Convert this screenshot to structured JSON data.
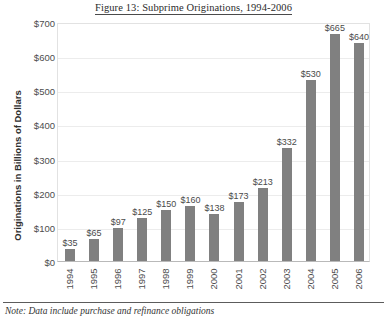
{
  "chart_data": {
    "type": "bar",
    "title": "Figure 13: Subprime Originations, 1994-2006",
    "xlabel": "",
    "ylabel": "Originations in Billions of Dollars",
    "categories": [
      "1994",
      "1995",
      "1996",
      "1997",
      "1998",
      "1999",
      "2000",
      "2001",
      "2002",
      "2003",
      "2004",
      "2005",
      "2006"
    ],
    "values": [
      35,
      65,
      97,
      125,
      150,
      160,
      138,
      173,
      213,
      332,
      530,
      665,
      640
    ],
    "data_labels": [
      "$35",
      "$65",
      "$97",
      "$125",
      "$150",
      "$160",
      "$138",
      "$173",
      "$213",
      "$332",
      "$530",
      "$665",
      "$640"
    ],
    "ylim": [
      0,
      700
    ],
    "ytick_values": [
      0,
      100,
      200,
      300,
      400,
      500,
      600,
      700
    ],
    "ytick_labels": [
      "$0",
      "$100",
      "$200",
      "$300",
      "$400",
      "$500",
      "$600",
      "$700"
    ],
    "grid": true,
    "legend": false,
    "bar_color": "#808080",
    "gridline_color": "#ececec",
    "plot_border_color": "#e2e2e2"
  },
  "footnote": {
    "text": "Note: Data include purchase and refinance obligations"
  }
}
